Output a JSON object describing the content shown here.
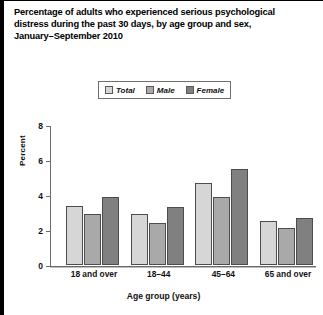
{
  "title": {
    "lines": [
      "Percentage of adults who experienced serious psychological",
      "distress during the past 30 days, by age group and sex,",
      "January–September 2010"
    ]
  },
  "legend": {
    "position": "top-center",
    "items": [
      {
        "label": "Total",
        "color": "#d6d6d6"
      },
      {
        "label": "Male",
        "color": "#a9a9a9"
      },
      {
        "label": "Female",
        "color": "#808080"
      }
    ]
  },
  "axes": {
    "y": {
      "label": "Percent",
      "ticks": [
        "0",
        "2",
        "4",
        "6",
        "8"
      ],
      "min": 0,
      "max": 8
    },
    "x": {
      "label": "Age group (years)",
      "categories": [
        "18 and over",
        "18–44",
        "45–64",
        "65 and over"
      ]
    }
  },
  "chart_data": {
    "type": "bar",
    "title": "Percentage of adults who experienced serious psychological distress during the past 30 days, by age group and sex, January–September 2010",
    "xlabel": "Age group (years)",
    "ylabel": "Percent",
    "ylim": [
      0,
      8
    ],
    "yticks": [
      0,
      2,
      4,
      6,
      8
    ],
    "grid": false,
    "legend_position": "top-center",
    "categories": [
      "18 and over",
      "18–44",
      "45–64",
      "65 and over"
    ],
    "series": [
      {
        "name": "Total",
        "color": "#d6d6d6",
        "values": [
          3.4,
          2.9,
          4.7,
          2.5
        ]
      },
      {
        "name": "Male",
        "color": "#a9a9a9",
        "values": [
          2.9,
          2.4,
          3.9,
          2.1
        ]
      },
      {
        "name": "Female",
        "color": "#808080",
        "values": [
          3.9,
          3.3,
          5.5,
          2.7
        ]
      }
    ]
  }
}
